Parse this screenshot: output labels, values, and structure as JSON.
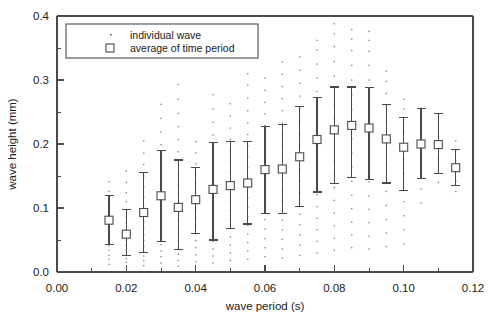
{
  "figure": {
    "background": "#ffffff",
    "ink_color": "#4a4a4a",
    "text_color": "#1a1a1a"
  },
  "legend": {
    "position": "top-left-inside",
    "entries": [
      {
        "label": "individual wave",
        "marker": "dot"
      },
      {
        "label": "average of time period",
        "marker": "open-square"
      }
    ]
  },
  "chart_data": {
    "type": "scatter",
    "title": "",
    "subtitle": "",
    "xlabel": "wave period (s)",
    "ylabel": "wave height (mm)",
    "xlim": [
      0.0,
      0.12
    ],
    "ylim": [
      0.0,
      0.4
    ],
    "xticks": [
      0.0,
      0.02,
      0.04,
      0.06,
      0.08,
      0.1,
      0.12
    ],
    "xtick_labels": [
      "0.00",
      "0.02",
      "0.04",
      "0.06",
      "0.08",
      "0.10",
      "0.12"
    ],
    "xminor_ticks": [
      0.01,
      0.03,
      0.05,
      0.07,
      0.09,
      0.11
    ],
    "yticks": [
      0.0,
      0.1,
      0.2,
      0.3,
      0.4
    ],
    "ytick_labels": [
      "0.0",
      "0.1",
      "0.2",
      "0.3",
      "0.4"
    ],
    "yminor_ticks": [
      0.05,
      0.15,
      0.25,
      0.35
    ],
    "grid": false,
    "legend_position": "upper left",
    "series": [
      {
        "name": "average of time period",
        "marker": "open-square",
        "x": [
          0.015,
          0.02,
          0.025,
          0.03,
          0.035,
          0.04,
          0.045,
          0.05,
          0.055,
          0.06,
          0.065,
          0.07,
          0.075,
          0.08,
          0.085,
          0.09,
          0.095,
          0.1,
          0.105,
          0.11,
          0.115
        ],
        "values": [
          0.081,
          0.059,
          0.093,
          0.119,
          0.101,
          0.113,
          0.129,
          0.135,
          0.139,
          0.16,
          0.161,
          0.18,
          0.207,
          0.222,
          0.229,
          0.225,
          0.208,
          0.195,
          0.2,
          0.199,
          0.163
        ],
        "err_low": [
          0.043,
          0.026,
          0.031,
          0.048,
          0.035,
          0.06,
          0.05,
          0.068,
          0.075,
          0.092,
          0.091,
          0.103,
          0.125,
          0.138,
          0.148,
          0.145,
          0.139,
          0.128,
          0.146,
          0.154,
          0.135
        ],
        "err_high": [
          0.12,
          0.097,
          0.155,
          0.19,
          0.175,
          0.163,
          0.202,
          0.204,
          0.204,
          0.227,
          0.23,
          0.258,
          0.273,
          0.289,
          0.289,
          0.288,
          0.262,
          0.242,
          0.255,
          0.247,
          0.192
        ]
      },
      {
        "name": "individual wave",
        "marker": "dot",
        "note": "scatter cloud of individual wave measurements at each time period bin",
        "bins": [
          {
            "x": 0.015,
            "y": [
              0.012,
              0.02,
              0.026,
              0.034,
              0.041,
              0.048,
              0.056,
              0.065,
              0.073,
              0.082,
              0.09,
              0.101,
              0.112,
              0.126,
              0.141
            ]
          },
          {
            "x": 0.02,
            "y": [
              0.008,
              0.015,
              0.021,
              0.028,
              0.034,
              0.042,
              0.05,
              0.058,
              0.067,
              0.076,
              0.086,
              0.097,
              0.11,
              0.124,
              0.14,
              0.158
            ]
          },
          {
            "x": 0.025,
            "y": [
              0.01,
              0.018,
              0.025,
              0.032,
              0.04,
              0.049,
              0.058,
              0.068,
              0.079,
              0.09,
              0.103,
              0.117,
              0.133,
              0.15,
              0.168,
              0.186,
              0.205
            ]
          },
          {
            "x": 0.03,
            "y": [
              0.014,
              0.024,
              0.033,
              0.043,
              0.053,
              0.064,
              0.075,
              0.087,
              0.1,
              0.114,
              0.129,
              0.145,
              0.162,
              0.18,
              0.199,
              0.219,
              0.24,
              0.262
            ]
          },
          {
            "x": 0.035,
            "y": [
              0.009,
              0.018,
              0.028,
              0.038,
              0.048,
              0.059,
              0.07,
              0.082,
              0.095,
              0.108,
              0.122,
              0.137,
              0.153,
              0.17,
              0.188,
              0.207,
              0.227,
              0.248,
              0.27,
              0.293
            ]
          },
          {
            "x": 0.04,
            "y": [
              0.016,
              0.027,
              0.038,
              0.049,
              0.06,
              0.072,
              0.084,
              0.097,
              0.11,
              0.124,
              0.138,
              0.153,
              0.169,
              0.186,
              0.204
            ]
          },
          {
            "x": 0.045,
            "y": [
              0.014,
              0.025,
              0.036,
              0.048,
              0.06,
              0.073,
              0.086,
              0.1,
              0.114,
              0.129,
              0.144,
              0.16,
              0.177,
              0.195,
              0.214,
              0.234,
              0.255,
              0.277
            ]
          },
          {
            "x": 0.05,
            "y": [
              0.018,
              0.03,
              0.042,
              0.055,
              0.068,
              0.082,
              0.096,
              0.11,
              0.125,
              0.14,
              0.156,
              0.172,
              0.189,
              0.207,
              0.225,
              0.244,
              0.263
            ]
          },
          {
            "x": 0.055,
            "y": [
              0.02,
              0.033,
              0.046,
              0.059,
              0.073,
              0.087,
              0.101,
              0.116,
              0.131,
              0.147,
              0.163,
              0.18,
              0.197,
              0.215,
              0.233,
              0.252,
              0.272,
              0.292,
              0.31
            ]
          },
          {
            "x": 0.06,
            "y": [
              0.024,
              0.038,
              0.052,
              0.067,
              0.082,
              0.097,
              0.112,
              0.128,
              0.144,
              0.16,
              0.177,
              0.194,
              0.211,
              0.229,
              0.247,
              0.265,
              0.284,
              0.303
            ]
          },
          {
            "x": 0.065,
            "y": [
              0.022,
              0.036,
              0.051,
              0.066,
              0.081,
              0.096,
              0.112,
              0.128,
              0.145,
              0.162,
              0.179,
              0.197,
              0.215,
              0.233,
              0.252,
              0.271,
              0.29,
              0.309,
              0.328
            ]
          },
          {
            "x": 0.07,
            "y": [
              0.026,
              0.042,
              0.058,
              0.074,
              0.09,
              0.107,
              0.124,
              0.142,
              0.16,
              0.178,
              0.197,
              0.216,
              0.235,
              0.255,
              0.275,
              0.295,
              0.315,
              0.336
            ]
          },
          {
            "x": 0.075,
            "y": [
              0.03,
              0.048,
              0.066,
              0.084,
              0.102,
              0.121,
              0.14,
              0.159,
              0.179,
              0.199,
              0.219,
              0.24,
              0.261,
              0.282,
              0.303,
              0.325,
              0.347,
              0.362
            ]
          },
          {
            "x": 0.08,
            "y": [
              0.034,
              0.053,
              0.072,
              0.092,
              0.112,
              0.132,
              0.153,
              0.174,
              0.195,
              0.217,
              0.239,
              0.261,
              0.283,
              0.306,
              0.329,
              0.352,
              0.372,
              0.388
            ]
          },
          {
            "x": 0.085,
            "y": [
              0.038,
              0.058,
              0.078,
              0.099,
              0.12,
              0.142,
              0.164,
              0.186,
              0.208,
              0.231,
              0.254,
              0.277,
              0.3,
              0.323,
              0.346,
              0.364,
              0.379
            ]
          },
          {
            "x": 0.09,
            "y": [
              0.036,
              0.056,
              0.077,
              0.098,
              0.119,
              0.141,
              0.163,
              0.185,
              0.208,
              0.231,
              0.254,
              0.277,
              0.3,
              0.323,
              0.345,
              0.362,
              0.376
            ]
          },
          {
            "x": 0.095,
            "y": [
              0.04,
              0.061,
              0.082,
              0.104,
              0.126,
              0.148,
              0.17,
              0.192,
              0.214,
              0.236,
              0.258,
              0.279,
              0.298,
              0.314
            ]
          },
          {
            "x": 0.1,
            "y": [
              0.044,
              0.066,
              0.088,
              0.11,
              0.132,
              0.154,
              0.176,
              0.198,
              0.219,
              0.238,
              0.255,
              0.27
            ]
          },
          {
            "x": 0.105,
            "y": [
              0.108,
              0.13,
              0.152,
              0.174,
              0.196,
              0.218,
              0.238,
              0.256
            ]
          },
          {
            "x": 0.11,
            "y": [
              0.14,
              0.158,
              0.176,
              0.194,
              0.212,
              0.23,
              0.247
            ]
          },
          {
            "x": 0.115,
            "y": [
              0.126,
              0.142,
              0.158,
              0.174,
              0.19,
              0.205
            ]
          }
        ]
      }
    ]
  }
}
